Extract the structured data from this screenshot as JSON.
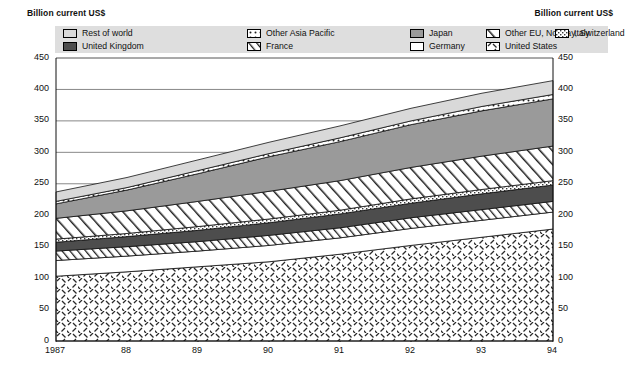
{
  "axis_caption_left": "Billion current US$",
  "axis_caption_right": "Billion current US$",
  "legend": {
    "items": [
      {
        "label": "Rest of world",
        "pattern": "solid-light",
        "color": "#d9d9d9",
        "row": 0,
        "col": "col-a"
      },
      {
        "label": "Other Asia Pacific",
        "pattern": "dots",
        "color": "#ffffff",
        "row": 0,
        "col": "col-b"
      },
      {
        "label": "Japan",
        "pattern": "solid-mid",
        "color": "#9a9a9a",
        "row": 0,
        "col": "col-c"
      },
      {
        "label": "Other EU, Norway, Switzerland",
        "pattern": "diag-wide",
        "color": "#ffffff",
        "row": 0,
        "col": "col-d"
      },
      {
        "label": "Italy",
        "pattern": "fine-texture",
        "color": "#ffffff",
        "row": 0,
        "col": "col-e"
      },
      {
        "label": "United Kingdom",
        "pattern": "solid-dark",
        "color": "#4d4d4d",
        "row": 1,
        "col": "col-a"
      },
      {
        "label": "France",
        "pattern": "diag-narrow",
        "color": "#ffffff",
        "row": 1,
        "col": "col-b"
      },
      {
        "label": "Germany",
        "pattern": "solid-white",
        "color": "#ffffff",
        "row": 1,
        "col": "col-c"
      },
      {
        "label": "United States",
        "pattern": "cross-dash",
        "color": "#ffffff",
        "row": 1,
        "col": "col-d"
      }
    ]
  },
  "chart_data": {
    "type": "area",
    "stacked": true,
    "title": "",
    "subtitle": "",
    "xlabel": "",
    "ylabel": "Billion current US$",
    "ylim": [
      0,
      450
    ],
    "ytick_step": 50,
    "yticks": [
      0,
      50,
      100,
      150,
      200,
      250,
      300,
      350,
      400,
      450
    ],
    "grid": true,
    "grid_axis": "y",
    "legend_position": "top",
    "dual_y_axis": true,
    "x": [
      "1987",
      "88",
      "89",
      "90",
      "91",
      "92",
      "93",
      "94"
    ],
    "x_tick_labels": [
      "1987",
      "88",
      "89",
      "90",
      "91",
      "92",
      "93",
      "94"
    ],
    "stack_order_bottom_to_top": [
      "United States",
      "Germany",
      "France",
      "United Kingdom",
      "Italy",
      "Other EU, Norway, Switzerland",
      "Japan",
      "Other Asia Pacific",
      "Rest of world"
    ],
    "series": [
      {
        "name": "United States",
        "pattern": "cross-dash",
        "color": "#ffffff",
        "values": [
          103,
          110,
          118,
          126,
          138,
          152,
          165,
          178
        ]
      },
      {
        "name": "Germany",
        "pattern": "solid-white",
        "color": "#ffffff",
        "values": [
          25,
          25,
          25,
          26,
          26,
          27,
          27,
          27
        ]
      },
      {
        "name": "France",
        "pattern": "diag-narrow",
        "color": "#ffffff",
        "values": [
          15,
          15,
          15,
          16,
          16,
          17,
          17,
          17
        ]
      },
      {
        "name": "United Kingdom",
        "pattern": "solid-dark",
        "color": "#4d4d4d",
        "values": [
          14,
          16,
          18,
          20,
          22,
          23,
          25,
          26
        ]
      },
      {
        "name": "Italy",
        "pattern": "fine-texture",
        "color": "#ffffff",
        "values": [
          5,
          5,
          6,
          6,
          6,
          7,
          7,
          7
        ]
      },
      {
        "name": "Other EU, Norway, Switzerland",
        "pattern": "diag-wide",
        "color": "#ffffff",
        "values": [
          33,
          36,
          40,
          44,
          47,
          50,
          53,
          55
        ]
      },
      {
        "name": "Japan",
        "pattern": "solid-mid",
        "color": "#9a9a9a",
        "values": [
          23,
          33,
          44,
          55,
          62,
          68,
          72,
          75
        ]
      },
      {
        "name": "Other Asia Pacific",
        "pattern": "dots",
        "color": "#ffffff",
        "values": [
          4,
          4,
          5,
          5,
          6,
          6,
          7,
          7
        ]
      },
      {
        "name": "Rest of world",
        "pattern": "solid-light",
        "color": "#d9d9d9",
        "values": [
          15,
          16,
          17,
          18,
          19,
          20,
          21,
          22
        ]
      }
    ],
    "totals": [
      237,
      260,
      288,
      316,
      342,
      370,
      394,
      414
    ],
    "annotations": []
  }
}
